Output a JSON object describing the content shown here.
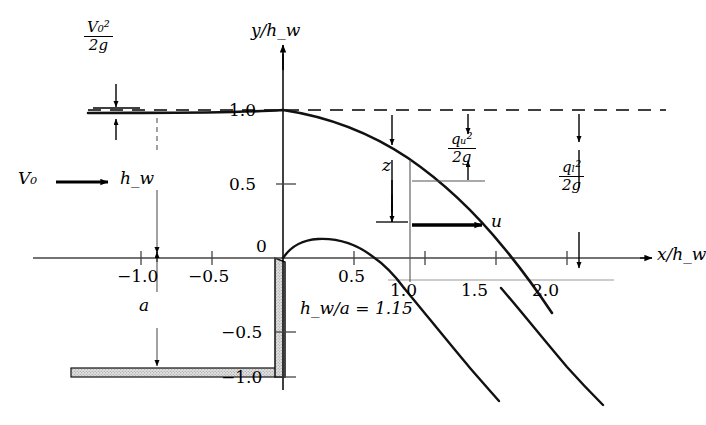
{
  "figure": {
    "kind": "sharp-crested-weir-nappe-trajectory-diagram",
    "condition_label": "h_w/a = 1.15"
  },
  "axes": {
    "x_axis_label": "x/h_w",
    "y_axis_label": "y/h_w",
    "x_ticks": [
      {
        "value": -1.0,
        "label": "−1.0"
      },
      {
        "value": -0.5,
        "label": "−0.5"
      },
      {
        "value": 0.5,
        "label": "0.5"
      },
      {
        "value": 1.0,
        "label": "1.0"
      },
      {
        "value": 1.5,
        "label": "1.5"
      },
      {
        "value": 2.0,
        "label": "2.0"
      }
    ],
    "y_ticks": [
      {
        "value": 1.0,
        "label": "1.0"
      },
      {
        "value": 0.5,
        "label": "0.5"
      },
      {
        "value": 0.0,
        "label": "0"
      },
      {
        "value": -0.5,
        "label": "−0.5"
      },
      {
        "value": -1.0,
        "label": "−1.0"
      }
    ],
    "x_range": [
      -1.35,
      2.45
    ],
    "y_range": [
      -1.15,
      1.3
    ]
  },
  "annotations": {
    "velocity_head": {
      "name": "V0-squared-over-2g",
      "num": "V₀²",
      "den": "2g"
    },
    "upper_nappe_head": {
      "name": "qu-squared-over-2g",
      "num": "qᵤ²",
      "den": "2g"
    },
    "lower_nappe_head": {
      "name": "ql-squared-over-2g",
      "num": "qₗ²",
      "den": "2g"
    },
    "drop_height": "z",
    "weir_height": "a",
    "head_on_weir": "h_w",
    "approach_velocity": "V₀",
    "jet_velocity": "u"
  },
  "curves": {
    "free_surface_upper_nappe": {
      "name": "upper-nappe",
      "points": [
        [
          -1.35,
          1.045
        ],
        [
          -1.0,
          1.043
        ],
        [
          -0.6,
          1.036
        ],
        [
          -0.3,
          1.022
        ],
        [
          0.0,
          1.0
        ],
        [
          0.2,
          0.965
        ],
        [
          0.4,
          0.915
        ],
        [
          0.6,
          0.845
        ],
        [
          0.8,
          0.755
        ],
        [
          1.0,
          0.645
        ],
        [
          1.2,
          0.51
        ],
        [
          1.4,
          0.355
        ],
        [
          1.55,
          0.22
        ],
        [
          1.68,
          0.09
        ],
        [
          1.78,
          -0.03
        ]
      ]
    },
    "lower_nappe": {
      "name": "lower-nappe",
      "points": [
        [
          0.0,
          0.0
        ],
        [
          0.1,
          0.075
        ],
        [
          0.22,
          0.115
        ],
        [
          0.35,
          0.128
        ],
        [
          0.5,
          0.118
        ],
        [
          0.65,
          0.082
        ],
        [
          0.8,
          0.025
        ],
        [
          0.92,
          -0.05
        ],
        [
          1.0,
          -0.115
        ]
      ]
    },
    "lower_nappe_trajectory_inner": {
      "name": "nappe-trajectory-inner",
      "points": [
        [
          1.0,
          -0.115
        ],
        [
          1.15,
          -0.3
        ],
        [
          1.33,
          -0.52
        ],
        [
          1.5,
          -0.73
        ],
        [
          1.63,
          -0.9
        ],
        [
          1.72,
          -1.02
        ]
      ]
    },
    "lower_nappe_trajectory_outer": {
      "name": "nappe-trajectory-outer",
      "points": [
        [
          1.5,
          -0.12
        ],
        [
          1.63,
          -0.3
        ],
        [
          1.8,
          -0.53
        ],
        [
          1.97,
          -0.76
        ],
        [
          2.1,
          -0.93
        ],
        [
          2.18,
          -1.05
        ]
      ]
    }
  },
  "structure": {
    "weir_plate": {
      "name": "weir-plate",
      "x": 0.0,
      "top_y": 0.0,
      "bottom_y": -1.0
    },
    "floor": {
      "name": "channel-floor",
      "y": -1.0,
      "x_from": -1.62,
      "x_to": 0.0
    }
  }
}
